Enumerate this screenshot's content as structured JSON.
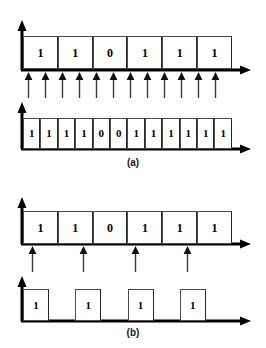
{
  "figure": {
    "title_a": "(a)",
    "title_b": "(b)",
    "axis_color": "#000000",
    "cell_border_color": "#4d4d4d",
    "tick_color": "#3c3c3c"
  },
  "panel_a": {
    "caption": "(a)",
    "input_row": {
      "name": "input-data-waveform",
      "bits": [
        "1",
        "1",
        "0",
        "1",
        "1",
        "1"
      ],
      "cell_count": 6
    },
    "sampling_ticks": {
      "name": "sampling-clock-arrows",
      "count": 12,
      "positions": [
        28,
        45,
        62,
        79,
        96,
        113,
        130,
        147,
        164,
        181,
        198,
        215
      ]
    },
    "output_row": {
      "name": "encoded-output-waveform",
      "bits": [
        "1",
        "1",
        "1",
        "1",
        "0",
        "0",
        "1",
        "1",
        "1",
        "1",
        "1",
        "1"
      ],
      "cell_count": 12
    }
  },
  "panel_b": {
    "caption": "(b)",
    "input_row": {
      "name": "input-data-waveform",
      "bits": [
        "1",
        "1",
        "0",
        "1",
        "1",
        "1"
      ],
      "cell_count": 6
    },
    "sampling_ticks": {
      "name": "sampling-clock-arrows",
      "count": 4,
      "positions": [
        32,
        83,
        135,
        187
      ]
    },
    "output_row": {
      "name": "encoded-output-waveform",
      "pulses": [
        {
          "label": "1",
          "filled": true
        },
        {
          "label": "",
          "filled": false
        },
        {
          "label": "1",
          "filled": true
        },
        {
          "label": "",
          "filled": false
        },
        {
          "label": "1",
          "filled": true
        },
        {
          "label": "",
          "filled": false
        },
        {
          "label": "1",
          "filled": true
        },
        {
          "label": "",
          "filled": false
        }
      ],
      "pulse_count": 4
    }
  }
}
